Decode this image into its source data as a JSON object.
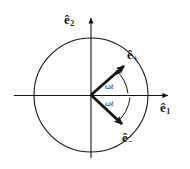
{
  "figure": {
    "background_color": "#ffffff",
    "stroke_color": "#141414",
    "axes": {
      "horizontal_label_base": "e",
      "horizontal_label_sub": "1",
      "horizontal_label_full": "ê₁",
      "vertical_label_base": "e",
      "vertical_label_sub": "2",
      "vertical_label_full": "ê₂"
    },
    "circle": {
      "center_x": 91,
      "center_y": 95,
      "radius": 57
    },
    "vectors": [
      {
        "name": "e-plus",
        "label_base": "e",
        "label_sub": "+",
        "label_full": "ê₊",
        "angle_degrees": 41,
        "tip_x": 128,
        "tip_y": 62
      },
      {
        "name": "e-minus",
        "label_base": "e",
        "label_sub": "−",
        "label_full": "ê₋",
        "angle_degrees": -41,
        "tip_x": 126,
        "tip_y": 129
      }
    ],
    "angle_arcs": [
      {
        "name": "omega-t-upper",
        "label": "ωt"
      },
      {
        "name": "omega-t-lower",
        "label": "ωt"
      }
    ]
  }
}
